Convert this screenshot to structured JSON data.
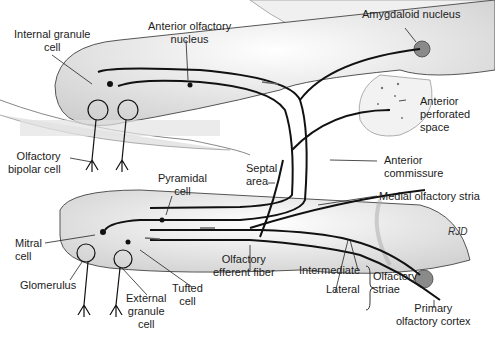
{
  "diagram": {
    "labels": {
      "internal_granule_cell": [
        "Internal granule",
        "cell"
      ],
      "anterior_olfactory_nucleus": [
        "Anterior olfactory",
        "nucleus"
      ],
      "amygdaloid_nucleus": "Amygdaloid nucleus",
      "anterior_perforated_space": [
        "Anterior",
        "perforated",
        "space"
      ],
      "olfactory_bipolar_cell": [
        "Olfactory",
        "bipolar cell"
      ],
      "septal_area": [
        "Septal",
        "area"
      ],
      "anterior_commissure": [
        "Anterior",
        "commissure"
      ],
      "pyramidal_cell": [
        "Pyramidal",
        "cell"
      ],
      "medial_olfactory_stria": "Medial olfactory stria",
      "mitral_cell": [
        "Mitral",
        "cell"
      ],
      "olfactory_efferent_fiber": [
        "Olfactory",
        "efferent fiber"
      ],
      "glomerulus": "Glomerulus",
      "tufted_cell": [
        "Tufted",
        "cell"
      ],
      "external_granule_cell": [
        "External",
        "granule",
        "cell"
      ],
      "intermediate": "Intermediate",
      "lateral": "Lateral",
      "olfactory_striae": [
        "Olfactory",
        "striae"
      ],
      "primary_olfactory_cortex": [
        "Primary",
        "olfactory cortex"
      ]
    },
    "signature": "RJD",
    "colors": {
      "line": "#111111",
      "shade": "#d9d9d9",
      "nucleus": "#8a8a8a"
    }
  }
}
